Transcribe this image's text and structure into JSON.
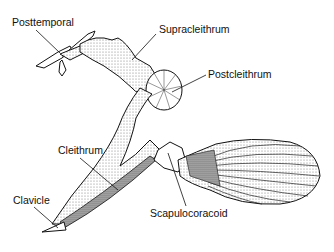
{
  "diagram": {
    "labels": {
      "posttemporal": "Posttemporal",
      "supracleithrum": "Supracleithrum",
      "postcleithrum": "Postcleithrum",
      "cleithrum": "Cleithrum",
      "clavicle": "Clavicle",
      "scapulocoracoid": "Scapulocoracoid"
    }
  }
}
